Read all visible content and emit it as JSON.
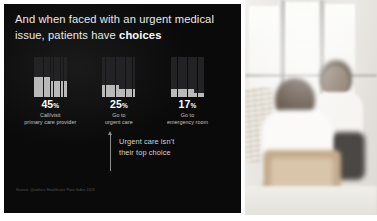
{
  "slide": {
    "headline_prefix": "And when faced with an urgent medical issue, patients have ",
    "headline_emphasis": "choices",
    "source": "Source: Qualtrics Healthcare Pass Index 2019",
    "background_color": "#0a0a0a",
    "accent_color": "#b9b9ba"
  },
  "annotation": {
    "line1": "Urgent care isn't",
    "line2": "their top choice",
    "arrow": "up-arrow-icon"
  },
  "chart_data": {
    "type": "bar",
    "subtype": "waffle",
    "title": "And when faced with an urgent medical issue, patients have choices",
    "categories": [
      "Call/visit primary care provider",
      "Go to urgent care",
      "Go to emergency room"
    ],
    "values": [
      45,
      25,
      17
    ],
    "unit": "%",
    "grid_rows": 10,
    "grid_cols": 10,
    "total_cells": 100,
    "filled_color": "#b9b9ba",
    "empty_color": "#232325",
    "xlabel": "",
    "ylabel": "",
    "ylim": [
      0,
      100
    ],
    "legend": false,
    "grid": false,
    "annotation": "Urgent care isn't their top choice",
    "source": "Source: Qualtrics Healthcare Pass Index 2019"
  },
  "metrics": [
    {
      "percent": "45",
      "symbol": "%",
      "desc_line1": "Call/visit",
      "desc_line2": "primary care provider",
      "value": 45
    },
    {
      "percent": "25",
      "symbol": "%",
      "desc_line1": "Go to",
      "desc_line2": "urgent care",
      "value": 25
    },
    {
      "percent": "17",
      "symbol": "%",
      "desc_line1": "Go to",
      "desc_line2": "emergency room",
      "value": 17
    }
  ],
  "photo": {
    "alt": "Two people in conversation in a bright healthcare waiting area"
  }
}
